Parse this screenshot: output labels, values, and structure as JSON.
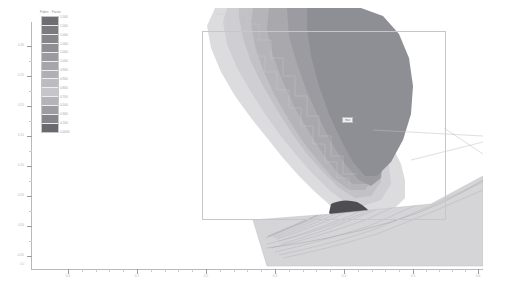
{
  "figure": {
    "background_color": "#ffffff",
    "axis_color": "#b9b9bd"
  },
  "legend": {
    "title_words": [
      "Fabric",
      "Factor"
    ],
    "orientation": "vertical",
    "colormap": "grayscale-discrete",
    "band_colors": [
      "#6e6e71",
      "#7b7b7e",
      "#86868a",
      "#8f8f93",
      "#9b9b9f",
      "#a6a6aa",
      "#b0b0b4",
      "#bcbcc0",
      "#c6c6ca",
      "#b4b4b8",
      "#9d9da1",
      "#86868a",
      "#6a6a6e"
    ],
    "tick_values": [
      "1.000",
      "1.000",
      "1.000",
      "1.000",
      "1.000",
      "1.000",
      "0.900",
      "0.900",
      "0.800",
      "0.700",
      "0.500",
      "0.300",
      "0.200",
      "0.0000"
    ]
  },
  "axes": {
    "x_tick_labels": [
      "0.0",
      "0.1",
      "0.2",
      "0.3",
      "0.4",
      "0.5",
      "0.6"
    ],
    "x_tick_positions": [
      68,
      137,
      206,
      275,
      344,
      413,
      478
    ],
    "y_tick_labels": [
      "0.30",
      "0.25",
      "0.20",
      "0.15",
      "0.10",
      "0.05",
      "0.00",
      "-0.05"
    ],
    "y_tick_positions": [
      46,
      76,
      106,
      136,
      166,
      196,
      226,
      256
    ],
    "origin_label": "0.0"
  },
  "plot": {
    "type": "filled-contour",
    "description": "diagonal banded contour plume with stepped isolines",
    "contour_band_colors": [
      "#dcdcdf",
      "#cfcfd3",
      "#c2c2c6",
      "#b5b5b9",
      "#a8a8ad",
      "#9b9ba1",
      "#8e8e95"
    ],
    "dark_blob_color": "#4e4e52",
    "wedge_fill_color": "#d5d5d8",
    "streamline_color": "#b0b0b5"
  },
  "annotation": {
    "label": "max"
  },
  "chart_data": {
    "type": "heatmap",
    "title": "",
    "xlabel": "",
    "ylabel": "",
    "xlim": [
      0.0,
      0.6
    ],
    "ylim": [
      -0.05,
      0.3
    ],
    "grid": false,
    "legend_position": "upper-left",
    "colorbar_title": "Fabric Factor",
    "colorbar_ticks": [
      "1.000",
      "1.000",
      "1.000",
      "1.000",
      "1.000",
      "1.000",
      "0.900",
      "0.900",
      "0.800",
      "0.700",
      "0.500",
      "0.300",
      "0.200",
      "0.0000"
    ],
    "colorbar_range": [
      0.0,
      1.0
    ],
    "categories": [
      "0.0",
      "0.1",
      "0.2",
      "0.3",
      "0.4",
      "0.5",
      "0.6"
    ],
    "values": [
      1.0,
      0.9,
      0.8,
      0.7,
      0.5,
      0.3,
      0.0
    ],
    "annotations": [
      "max"
    ]
  }
}
